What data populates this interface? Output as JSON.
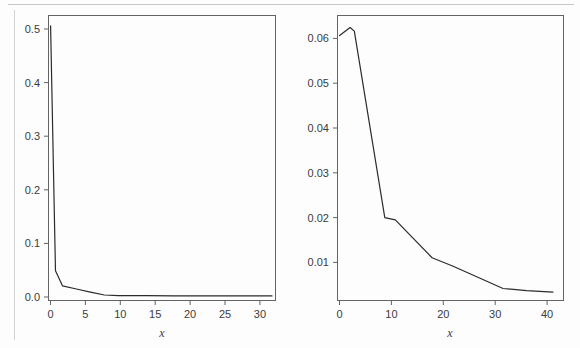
{
  "figure": {
    "background_color": "#fdfdfd",
    "axis_color": "#636363",
    "curve_color": "#2b2b2b",
    "tick_label_color": "#3b3b3b"
  },
  "chart_data": [
    {
      "id": "left-panel",
      "type": "line",
      "title": "",
      "xlabel": "x",
      "ylabel": "",
      "xlim": [
        0,
        32.5
      ],
      "ylim": [
        0,
        0.545
      ],
      "grid": false,
      "legend": "none",
      "xticks": [
        0,
        5,
        10,
        15,
        20,
        25,
        30
      ],
      "xtick_labels": [
        "0",
        "5",
        "10",
        "15",
        "20",
        "25",
        "30"
      ],
      "yticks": [
        0.0,
        0.1,
        0.2,
        0.3,
        0.4,
        0.5
      ],
      "ytick_labels": [
        "0.0",
        "0.1",
        "0.2",
        "0.3",
        "0.4",
        "0.5"
      ],
      "series": [
        {
          "name": "series-1",
          "x": [
            0.3,
            1.0,
            2.0,
            4.0,
            6.0,
            8.0,
            10.0,
            14.0,
            18.0,
            22.0,
            26.0,
            30.0,
            32.0
          ],
          "y": [
            0.525,
            0.057,
            0.028,
            0.022,
            0.016,
            0.0105,
            0.0095,
            0.0092,
            0.009,
            0.0089,
            0.0088,
            0.0088,
            0.0088
          ]
        }
      ]
    },
    {
      "id": "right-panel",
      "type": "line",
      "title": "",
      "xlabel": "x",
      "ylabel": "",
      "xlim": [
        0,
        43
      ],
      "ylim": [
        0.0015,
        0.0655
      ],
      "grid": false,
      "legend": "none",
      "xticks": [
        0,
        10,
        20,
        30,
        40
      ],
      "xtick_labels": [
        "0",
        "10",
        "20",
        "30",
        "40"
      ],
      "yticks": [
        0.01,
        0.02,
        0.03,
        0.04,
        0.05,
        0.06
      ],
      "ytick_labels": [
        "0.01",
        "0.02",
        "0.03",
        "0.04",
        "0.05",
        "0.06"
      ],
      "series": [
        {
          "name": "series-1",
          "x": [
            0.4,
            2.4,
            3.2,
            9.0,
            11.0,
            18.0,
            22.0,
            31.5,
            36.0,
            41.0
          ],
          "y": [
            0.061,
            0.0628,
            0.062,
            0.0201,
            0.0196,
            0.0111,
            0.0092,
            0.0042,
            0.0037,
            0.0034
          ]
        }
      ]
    }
  ]
}
